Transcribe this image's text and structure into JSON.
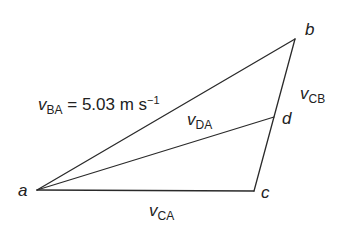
{
  "diagram": {
    "line_color": "#2a2a2a",
    "points": {
      "a": {
        "label": "a",
        "x": 37,
        "y": 190
      },
      "b": {
        "label": "b",
        "x": 295,
        "y": 39
      },
      "c": {
        "label": "c",
        "x": 254,
        "y": 191
      },
      "d": {
        "label": "d",
        "x": 274,
        "y": 117
      }
    },
    "edges": [
      {
        "from": "a",
        "to": "b",
        "name": "v_BA"
      },
      {
        "from": "b",
        "to": "c",
        "name": "v_CB"
      },
      {
        "from": "a",
        "to": "c",
        "name": "v_CA"
      },
      {
        "from": "a",
        "to": "d",
        "name": "v_DA"
      }
    ],
    "labels": {
      "v_ba": {
        "symbol": "v",
        "subscript": "BA",
        "equals": " = 5.03 m s",
        "superscript": "−1"
      },
      "v_da": {
        "symbol": "v",
        "subscript": "DA"
      },
      "v_cb": {
        "symbol": "v",
        "subscript": "CB"
      },
      "v_ca": {
        "symbol": "v",
        "subscript": "CA"
      }
    }
  }
}
